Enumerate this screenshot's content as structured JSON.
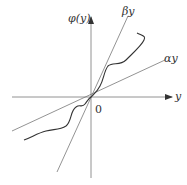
{
  "diagram": {
    "type": "sector-nonlinearity-plot",
    "colors": {
      "line": "#555555",
      "curve": "#333333",
      "text": "#333333",
      "background": "#ffffff"
    },
    "axes": {
      "x_label": "y",
      "y_label": "φ(y)",
      "origin_label": "0"
    },
    "sector_lines": [
      {
        "id": "beta",
        "label": "βy",
        "slope_desc": "upper bound (steeper)"
      },
      {
        "id": "alpha",
        "label": "αy",
        "slope_desc": "lower bound (shallower)"
      }
    ],
    "curve": {
      "label": "φ(y)",
      "description": "nonlinear function lying between αy and βy"
    }
  }
}
